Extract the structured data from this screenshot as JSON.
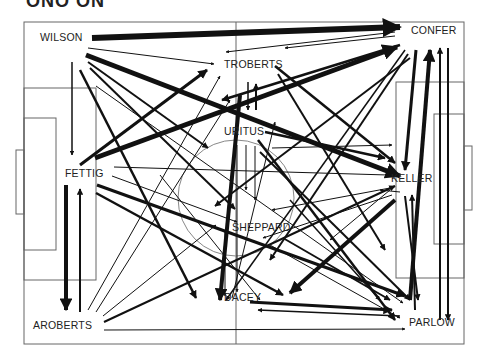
{
  "header": {
    "title_fragment": "ONO ON",
    "title_fragment_faded": "..."
  },
  "pitch": {
    "outer": [
      24,
      22,
      440,
      322
    ],
    "halfway_x": 236,
    "line_color": "#555555"
  },
  "players": [
    {
      "id": "WILSON",
      "label": "WILSON",
      "x": 63,
      "y": 37,
      "tx": 40,
      "ty": 41
    },
    {
      "id": "CONFER",
      "label": "CONFER",
      "x": 425,
      "y": 30,
      "tx": 411,
      "ty": 34
    },
    {
      "id": "TROBERTS",
      "label": "TROBERTS",
      "x": 253,
      "y": 64,
      "tx": 224,
      "ty": 68
    },
    {
      "id": "URITUS",
      "label": "URITUS",
      "x": 243,
      "y": 131,
      "tx": 224,
      "ty": 135
    },
    {
      "id": "FETTIG",
      "label": "FETTIG",
      "x": 82,
      "y": 173,
      "tx": 65,
      "ty": 177
    },
    {
      "id": "KELLER",
      "label": "KELLER",
      "x": 410,
      "y": 178,
      "tx": 391,
      "ty": 182
    },
    {
      "id": "SHEPPARD",
      "label": "SHEPPARD",
      "x": 263,
      "y": 227,
      "tx": 232,
      "ty": 231
    },
    {
      "id": "DACEY",
      "label": "DACEY",
      "x": 238,
      "y": 297,
      "tx": 224,
      "ty": 301
    },
    {
      "id": "AROBERTS",
      "label": "AROBERTS",
      "x": 62,
      "y": 325,
      "tx": 33,
      "ty": 329
    },
    {
      "id": "PARLOW",
      "label": "PARLOW",
      "x": 420,
      "y": 322,
      "tx": 409,
      "ty": 326
    }
  ],
  "passes": [
    {
      "from": [
        92,
        38
      ],
      "to": [
        400,
        27
      ],
      "w": 6
    },
    {
      "from": [
        88,
        48
      ],
      "to": [
        214,
        64
      ],
      "w": 1
    },
    {
      "from": [
        86,
        55
      ],
      "to": [
        400,
        176
      ],
      "w": 5
    },
    {
      "from": [
        88,
        62
      ],
      "to": [
        208,
        148
      ],
      "w": 2
    },
    {
      "from": [
        90,
        68
      ],
      "to": [
        235,
        209
      ],
      "w": 2
    },
    {
      "from": [
        80,
        70
      ],
      "to": [
        196,
        298
      ],
      "w": 2.5
    },
    {
      "from": [
        72,
        62
      ],
      "to": [
        72,
        155
      ],
      "w": 1.5
    },
    {
      "from": [
        96,
        86
      ],
      "to": [
        403,
        303
      ],
      "w": 1
    },
    {
      "from": [
        80,
        165
      ],
      "to": [
        207,
        70
      ],
      "w": 3
    },
    {
      "from": [
        95,
        158
      ],
      "to": [
        397,
        47
      ],
      "w": 5
    },
    {
      "from": [
        114,
        167
      ],
      "to": [
        388,
        175
      ],
      "w": 1
    },
    {
      "from": [
        112,
        176
      ],
      "to": [
        237,
        222
      ],
      "w": 1
    },
    {
      "from": [
        97,
        185
      ],
      "to": [
        405,
        296
      ],
      "w": 3
    },
    {
      "from": [
        96,
        193
      ],
      "to": [
        283,
        295
      ],
      "w": 2.5
    },
    {
      "from": [
        66,
        185
      ],
      "to": [
        66,
        310
      ],
      "w": 4
    },
    {
      "from": [
        80,
        312
      ],
      "to": [
        80,
        189
      ],
      "w": 2
    },
    {
      "from": [
        88,
        310
      ],
      "to": [
        220,
        76
      ],
      "w": 1
    },
    {
      "from": [
        96,
        312
      ],
      "to": [
        230,
        100
      ],
      "w": 1
    },
    {
      "from": [
        103,
        316
      ],
      "to": [
        216,
        225
      ],
      "w": 1
    },
    {
      "from": [
        104,
        322
      ],
      "to": [
        395,
        186
      ],
      "w": 2
    },
    {
      "from": [
        104,
        330
      ],
      "to": [
        405,
        329
      ],
      "w": 1
    },
    {
      "from": [
        395,
        36
      ],
      "to": [
        285,
        48
      ],
      "w": 1
    },
    {
      "from": [
        395,
        32
      ],
      "to": [
        226,
        52
      ],
      "w": 1
    },
    {
      "from": [
        400,
        45
      ],
      "to": [
        222,
        100
      ],
      "w": 2.5
    },
    {
      "from": [
        405,
        50
      ],
      "to": [
        226,
        300
      ],
      "w": 1.5
    },
    {
      "from": [
        408,
        54
      ],
      "to": [
        270,
        260
      ],
      "w": 2
    },
    {
      "from": [
        410,
        58
      ],
      "to": [
        215,
        206
      ],
      "w": 2
    },
    {
      "from": [
        416,
        50
      ],
      "to": [
        405,
        170
      ],
      "w": 3
    },
    {
      "from": [
        410,
        300
      ],
      "to": [
        430,
        50
      ],
      "w": 4
    },
    {
      "from": [
        440,
        320
      ],
      "to": [
        440,
        48
      ],
      "w": 2
    },
    {
      "from": [
        448,
        48
      ],
      "to": [
        448,
        320
      ],
      "w": 2
    },
    {
      "from": [
        278,
        74
      ],
      "to": [
        385,
        250
      ],
      "w": 2
    },
    {
      "from": [
        275,
        66
      ],
      "to": [
        395,
        163
      ],
      "w": 2.5
    },
    {
      "from": [
        248,
        82
      ],
      "to": [
        248,
        110
      ],
      "w": 1.5
    },
    {
      "from": [
        256,
        110
      ],
      "to": [
        256,
        84
      ],
      "w": 2
    },
    {
      "from": [
        240,
        95
      ],
      "to": [
        220,
        300
      ],
      "w": 4
    },
    {
      "from": [
        232,
        298
      ],
      "to": [
        275,
        122
      ],
      "w": 1
    },
    {
      "from": [
        258,
        140
      ],
      "to": [
        395,
        320
      ],
      "w": 2.5
    },
    {
      "from": [
        265,
        132
      ],
      "to": [
        385,
        158
      ],
      "w": 2.5
    },
    {
      "from": [
        272,
        148
      ],
      "to": [
        392,
        145
      ],
      "w": 1
    },
    {
      "from": [
        260,
        152
      ],
      "to": [
        410,
        300
      ],
      "w": 2
    },
    {
      "from": [
        237,
        145
      ],
      "to": [
        237,
        292
      ],
      "w": 1
    },
    {
      "from": [
        246,
        145
      ],
      "to": [
        246,
        190
      ],
      "w": 1
    },
    {
      "from": [
        255,
        146
      ],
      "to": [
        255,
        200
      ],
      "w": 1
    },
    {
      "from": [
        390,
        188
      ],
      "to": [
        272,
        210
      ],
      "w": 1
    },
    {
      "from": [
        392,
        195
      ],
      "to": [
        263,
        238
      ],
      "w": 1
    },
    {
      "from": [
        395,
        200
      ],
      "to": [
        290,
        293
      ],
      "w": 4
    },
    {
      "from": [
        390,
        190
      ],
      "to": [
        330,
        240
      ],
      "w": 1
    },
    {
      "from": [
        400,
        192
      ],
      "to": [
        380,
        190
      ],
      "w": 1
    },
    {
      "from": [
        405,
        196
      ],
      "to": [
        418,
        300
      ],
      "w": 2
    },
    {
      "from": [
        415,
        310
      ],
      "to": [
        412,
        195
      ],
      "w": 2
    },
    {
      "from": [
        283,
        238
      ],
      "to": [
        390,
        300
      ],
      "w": 2
    },
    {
      "from": [
        270,
        245
      ],
      "to": [
        400,
        318
      ],
      "w": 1
    },
    {
      "from": [
        250,
        302
      ],
      "to": [
        392,
        310
      ],
      "w": 3
    },
    {
      "from": [
        400,
        316
      ],
      "to": [
        258,
        310
      ],
      "w": 1.5
    },
    {
      "from": [
        290,
        200
      ],
      "to": [
        380,
        300
      ],
      "w": 1.5
    },
    {
      "from": [
        225,
        230
      ],
      "to": [
        225,
        296
      ],
      "w": 1
    },
    {
      "from": [
        160,
        175
      ],
      "to": [
        260,
        300
      ],
      "w": 1
    }
  ]
}
